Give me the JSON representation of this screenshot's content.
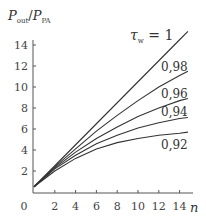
{
  "chart_data": {
    "type": "line",
    "title": "",
    "xlabel": "n",
    "ylabel": "P_out / P_PA",
    "ylabel_main": "P",
    "ylabel_sub1": "out",
    "ylabel_sub2": "PA",
    "xlim": [
      0,
      15
    ],
    "ylim": [
      0,
      15.5
    ],
    "x_ticks": [
      0,
      2,
      4,
      6,
      8,
      10,
      12,
      14
    ],
    "y_ticks": [
      2,
      4,
      6,
      8,
      10,
      12,
      14
    ],
    "x_tick_labels": [
      "0",
      "2",
      "4",
      "6",
      "8",
      "10",
      "12",
      "14"
    ],
    "y_tick_labels": [
      "2",
      "4",
      "6",
      "8",
      "10",
      "12",
      "14"
    ],
    "grid": false,
    "legend": "inline labels at curve ends",
    "x": [
      0,
      2,
      4,
      6,
      8,
      10,
      12,
      14,
      14.8
    ],
    "series": [
      {
        "name": "τ_w = 1",
        "label": "τw = 1",
        "values": [
          0.5,
          2.5,
          4.5,
          6.5,
          8.5,
          10.5,
          12.5,
          14.5,
          15.3
        ]
      },
      {
        "name": "0,98",
        "label": "0,98",
        "values": [
          0.5,
          2.4,
          4.1,
          5.8,
          7.3,
          8.7,
          10.0,
          11.1,
          11.5
        ]
      },
      {
        "name": "0,96",
        "label": "0,96",
        "values": [
          0.5,
          2.3,
          3.8,
          5.1,
          6.2,
          7.2,
          8.0,
          8.7,
          8.9
        ]
      },
      {
        "name": "0,94",
        "label": "0,94",
        "values": [
          0.5,
          2.2,
          3.5,
          4.6,
          5.4,
          6.1,
          6.6,
          7.0,
          7.1
        ]
      },
      {
        "name": "0,92",
        "label": "0,92",
        "values": [
          0.5,
          2.0,
          3.2,
          4.1,
          4.7,
          5.1,
          5.4,
          5.6,
          5.7
        ]
      }
    ]
  }
}
